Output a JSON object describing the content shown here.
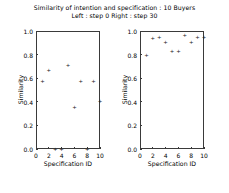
{
  "figure": {
    "title": "Similarity of intention and specification : 10 Buyers",
    "subtitle": "Left : step 0    Right : step 30"
  },
  "chart_data": [
    {
      "type": "scatter",
      "title": "Left : step 0",
      "xlabel": "Specification ID",
      "ylabel": "Similarity",
      "xlim": [
        0,
        10
      ],
      "ylim": [
        0.0,
        1.0
      ],
      "xticks": [
        "0",
        "2",
        "4",
        "6",
        "8",
        "10"
      ],
      "yticks": [
        "0.0",
        "0.2",
        "0.4",
        "0.6",
        "0.8",
        "1.0"
      ],
      "grid": false,
      "legend": "none",
      "marker": "+",
      "x": [
        1,
        2,
        3,
        4,
        5,
        6,
        7,
        8,
        9,
        10
      ],
      "values": [
        0.58,
        0.67,
        0.0,
        0.0,
        0.71,
        0.36,
        0.58,
        0.0,
        0.58,
        0.41
      ]
    },
    {
      "type": "scatter",
      "title": "Right : step 30",
      "xlabel": "Specification ID",
      "ylabel": "Similarity",
      "xlim": [
        0,
        10
      ],
      "ylim": [
        0.0,
        1.0
      ],
      "xticks": [
        "0",
        "2",
        "4",
        "6",
        "8",
        "10"
      ],
      "yticks": [
        "0.0",
        "0.2",
        "0.4",
        "0.6",
        "0.8",
        "1.0"
      ],
      "grid": false,
      "legend": "none",
      "marker": "+",
      "x": [
        1,
        2,
        3,
        4,
        5,
        6,
        7,
        8,
        9,
        10
      ],
      "values": [
        0.8,
        0.94,
        0.95,
        0.91,
        0.83,
        0.83,
        0.97,
        0.91,
        0.95,
        0.95
      ]
    }
  ]
}
